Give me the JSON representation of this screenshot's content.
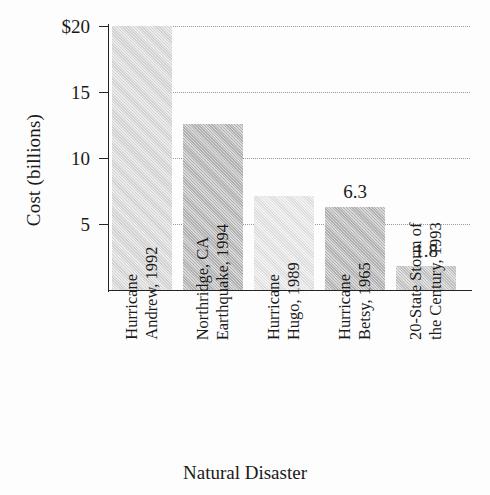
{
  "chart_data": {
    "type": "bar",
    "title": "",
    "xlabel": "Natural Disaster",
    "ylabel": "Cost (billions)",
    "ylim": [
      0,
      20
    ],
    "grid": true,
    "legend": "none",
    "y_ticks": [
      {
        "value": 20,
        "label": "$20"
      },
      {
        "value": 15,
        "label": "15"
      },
      {
        "value": 10,
        "label": "10"
      },
      {
        "value": 5,
        "label": "5"
      }
    ],
    "categories": [
      "Hurricane Andrew, 1992",
      "Northridge, CA Earthquake, 1994",
      "Hurricane Hugo, 1989",
      "Hurricane Betsy, 1965",
      "20-State Storm of the Century, 1993"
    ],
    "values": [
      20.0,
      12.6,
      7.1,
      6.3,
      1.8
    ],
    "bars": [
      {
        "category": "Hurricane Andrew, 1992",
        "lines": [
          "Hurricane",
          "Andrew, 1992"
        ],
        "value": 20.0,
        "data_label": "",
        "color": "#dcdcdc"
      },
      {
        "category": "Northridge, CA Earthquake, 1994",
        "lines": [
          "Northridge, CA",
          "Earthquake, 1994"
        ],
        "value": 12.6,
        "data_label": "",
        "color": "#b9b9b9"
      },
      {
        "category": "Hurricane Hugo, 1989",
        "lines": [
          "Hurricane",
          "Hugo, 1989"
        ],
        "value": 7.1,
        "data_label": "",
        "color": "#e9e9e9"
      },
      {
        "category": "Hurricane Betsy, 1965",
        "lines": [
          "Hurricane",
          "Betsy, 1965"
        ],
        "value": 6.3,
        "data_label": "6.3",
        "color": "#b9b9b9"
      },
      {
        "category": "20-State Storm of the Century, 1993",
        "lines": [
          "20-State Storm of",
          "the Century, 1993"
        ],
        "value": 1.8,
        "data_label": "1.8",
        "color": "#c8c8c8"
      }
    ]
  }
}
